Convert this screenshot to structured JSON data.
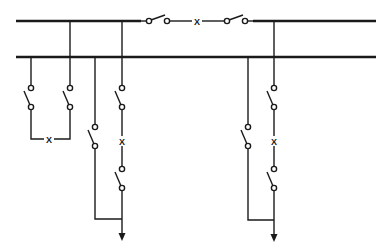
{
  "diagram": {
    "type": "double-busbar single-line diagram",
    "colors": {
      "line": "#1a1a1a",
      "background": "#ffffff"
    },
    "busbars": [
      {
        "id": "bus-1",
        "y": 21,
        "x1": 16,
        "x2": 376
      },
      {
        "id": "bus-2",
        "y": 57,
        "x1": 16,
        "x2": 376
      }
    ],
    "breaker_symbol": "X",
    "bus_coupler": {
      "y": 21,
      "switches": [
        {
          "x1": 149,
          "x2": 167
        },
        {
          "x1": 227,
          "x2": 245
        }
      ],
      "breaker_x": 197
    },
    "bus_section": {
      "left_x": 31,
      "right_x": 70,
      "switch_top": 88,
      "switch_bottom": 107,
      "loop_y": 139,
      "breaker_x": 49
    },
    "feeders": [
      {
        "id": "feeder-left",
        "branch_a_x": 95,
        "branch_b_x": 122,
        "join_y": 219,
        "arrow_tip_y": 241
      },
      {
        "id": "feeder-right",
        "branch_a_x": 248,
        "branch_b_x": 274,
        "join_y": 220,
        "arrow_tip_y": 242
      }
    ]
  }
}
